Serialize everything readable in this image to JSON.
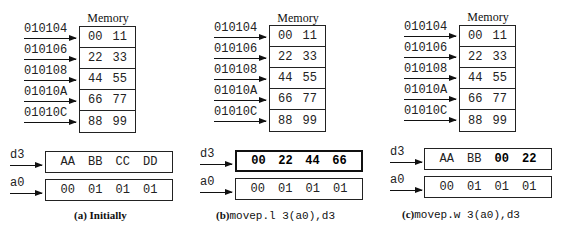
{
  "memory_title": "Memory",
  "addresses": [
    "010104",
    "010106",
    "010108",
    "01010A",
    "01010C"
  ],
  "memory": [
    [
      "00",
      "11"
    ],
    [
      "22",
      "33"
    ],
    [
      "44",
      "55"
    ],
    [
      "66",
      "77"
    ],
    [
      "88",
      "99"
    ]
  ],
  "registers": {
    "d3_label": "d3",
    "a0_label": "a0"
  },
  "panels": [
    {
      "caption_tag": "(a)",
      "caption_text": "Initially",
      "caption_code": "",
      "d3": [
        "AA",
        "BB",
        "CC",
        "DD"
      ],
      "d3_bold": [
        false,
        false,
        false,
        false
      ],
      "a0": [
        "00",
        "01",
        "01",
        "01"
      ]
    },
    {
      "caption_tag": "(b)",
      "caption_text": "",
      "caption_code": "movep.l 3(a0),d3",
      "d3": [
        "00",
        "22",
        "44",
        "66"
      ],
      "d3_bold": [
        true,
        true,
        true,
        true
      ],
      "a0": [
        "00",
        "01",
        "01",
        "01"
      ]
    },
    {
      "caption_tag": "(c)",
      "caption_text": "",
      "caption_code": "movep.w 3(a0),d3",
      "d3": [
        "AA",
        "BB",
        "00",
        "22"
      ],
      "d3_bold": [
        false,
        false,
        true,
        true
      ],
      "a0": [
        "00",
        "01",
        "01",
        "01"
      ]
    }
  ]
}
